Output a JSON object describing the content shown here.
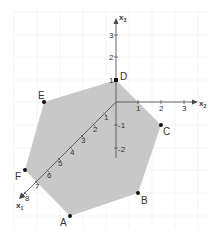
{
  "diagram": {
    "type": "3d-coordinate-system-hexagon",
    "colors": {
      "background": "#ffffff",
      "grid": "#eeeeee",
      "polygon_fill": "#c8c8c8",
      "axis": "#555555",
      "point": "#111111",
      "text": "#333333"
    },
    "axes": {
      "x1": {
        "label": "x",
        "subscript": "1",
        "ticks": [
          "1",
          "2",
          "3",
          "4",
          "5",
          "6",
          "7",
          "8"
        ]
      },
      "x2": {
        "label": "x",
        "subscript": "2",
        "ticks": [
          "1",
          "2",
          "3"
        ]
      },
      "x3": {
        "label": "x",
        "subscript": "3",
        "ticks_pos": [
          "1",
          "2",
          "3"
        ],
        "ticks_neg": [
          "-1",
          "-2"
        ]
      }
    },
    "points": {
      "A": "A",
      "B": "B",
      "C": "C",
      "D": "D",
      "E": "E",
      "F": "F"
    }
  }
}
